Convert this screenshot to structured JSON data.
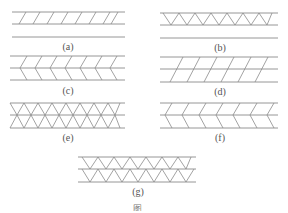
{
  "figure": {
    "panels": [
      {
        "id": "a",
        "label": "(a)",
        "pattern": "single-layer-parallel-diagonals-with-separate-plate"
      },
      {
        "id": "b",
        "label": "(b)",
        "pattern": "single-layer-V-zigzag-with-separate-plate"
      },
      {
        "id": "c",
        "label": "(c)",
        "pattern": "double-layer-chevron"
      },
      {
        "id": "d",
        "label": "(d)",
        "pattern": "double-layer-parallel-diagonals"
      },
      {
        "id": "e",
        "label": "(e)",
        "pattern": "double-layer-X-lattice"
      },
      {
        "id": "f",
        "label": "(f)",
        "pattern": "double-layer-herringbone"
      },
      {
        "id": "g",
        "label": "(g)",
        "pattern": "double-layer-stacked-V-zigzag"
      }
    ],
    "caption_fragment": "图"
  }
}
